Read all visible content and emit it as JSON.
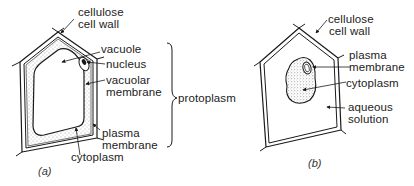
{
  "figure": {
    "panel_a": {
      "caption": "(a)",
      "labels": {
        "cell_wall_line1": "cellulose",
        "cell_wall_line2": "cell wall",
        "vacuole": "vacuole",
        "nucleus": "nucleus",
        "vacuolar_membrane_line1": "vacuolar",
        "vacuolar_membrane_line2": "membrane",
        "plasma_membrane_line1": "plasma",
        "plasma_membrane_line2": "membrane",
        "cytoplasm": "cytoplasm",
        "protoplasm": "protoplasm"
      }
    },
    "panel_b": {
      "caption": "(b)",
      "labels": {
        "cell_wall_line1": "cellulose",
        "cell_wall_line2": "cell wall",
        "plasma_membrane_line1": "plasma",
        "plasma_membrane_line2": "membrane",
        "cytoplasm": "cytoplasm",
        "aqueous_solution_line1": "aqueous",
        "aqueous_solution_line2": "solution"
      }
    },
    "colors": {
      "line": "#1a1a1a",
      "stipple": "#555555",
      "background": "#ffffff"
    }
  }
}
